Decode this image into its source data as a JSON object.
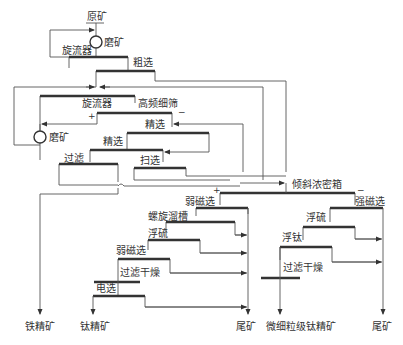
{
  "diagram": {
    "type": "process-flowsheet",
    "nodes": {
      "raw_ore": "原矿",
      "grinding_1": "磨矿",
      "cyclone_1": "旋流器",
      "roughing": "粗选",
      "cyclone_2": "旋流器",
      "hf_screen": "高频细筛",
      "grinding_2": "磨矿",
      "cleaning_1": "精选",
      "cleaning_2": "精选",
      "filtration": "过滤",
      "scavenging": "扫选",
      "thickener": "倾斜浓密箱",
      "weak_mag_1": "弱磁选",
      "spiral_chute": "螺旋溜槽",
      "float_sulfur_1": "浮硫",
      "weak_mag_2": "弱磁选",
      "filter_dry_1": "过滤干燥",
      "electrostatic": "电选",
      "strong_mag": "强磁选",
      "float_sulfur_2": "浮硫",
      "float_titanium": "浮钛",
      "filter_dry_2": "过滤干燥"
    },
    "signs": {
      "plus": "+",
      "minus": "−"
    },
    "products": {
      "iron_concentrate": "铁精矿",
      "titanium_concentrate": "钛精矿",
      "tailings_1": "尾矿",
      "fine_titanium_concentrate": "微细粒级钛精矿",
      "tailings_2": "尾矿"
    }
  }
}
